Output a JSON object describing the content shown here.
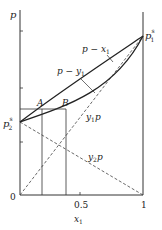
{
  "diagram": {
    "type": "vapor-liquid equilibrium p-x-y diagram",
    "axes": {
      "y_label": "p",
      "x_label": "x",
      "x_label_sub": "1",
      "x_ticks": [
        {
          "value": 0,
          "label": "0"
        },
        {
          "value": 0.5,
          "label": "0.5"
        },
        {
          "value": 1,
          "label": "1"
        }
      ]
    },
    "points": {
      "p1s": {
        "label": "p",
        "sup": "s",
        "sub": "1"
      },
      "p2s": {
        "label": "p",
        "sup": "s",
        "sub": "2"
      },
      "A": {
        "label": "A"
      },
      "B": {
        "label": "B"
      }
    },
    "curves": [
      {
        "name": "p-x1",
        "label_main": "p − x",
        "label_sub": "1",
        "style": "solid"
      },
      {
        "name": "p-y1",
        "label_main": "p − y",
        "label_sub": "1",
        "style": "solid"
      },
      {
        "name": "y1p",
        "label_main": "y",
        "label_sub": "1",
        "label_tail": "p",
        "style": "dashed"
      },
      {
        "name": "y2p",
        "label_main": "y",
        "label_sub": "2",
        "label_tail": "p",
        "style": "dashed"
      }
    ],
    "colors": {
      "line": "#333333",
      "background": "#ffffff"
    }
  }
}
